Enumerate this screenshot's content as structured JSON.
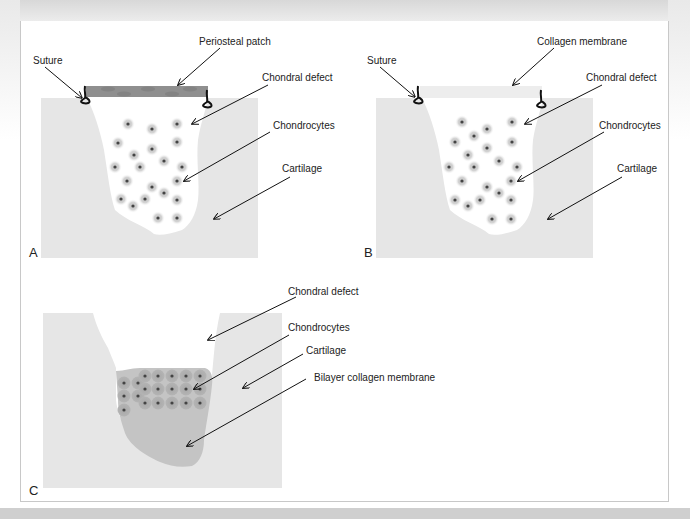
{
  "panels": {
    "A": {
      "letter": "A",
      "labels": {
        "suture": "Suture",
        "patch": "Periosteal patch",
        "defect": "Chondral defect",
        "chondrocytes": "Chondrocytes",
        "cartilage": "Cartilage"
      }
    },
    "B": {
      "letter": "B",
      "labels": {
        "suture": "Suture",
        "membrane": "Collagen membrane",
        "defect": "Chondral defect",
        "chondrocytes": "Chondrocytes",
        "cartilage": "Cartilage"
      }
    },
    "C": {
      "letter": "C",
      "labels": {
        "defect": "Chondral defect",
        "chondrocytes": "Chondrocytes",
        "cartilage": "Cartilage",
        "membrane": "Bilayer collagen membrane"
      }
    }
  },
  "colors": {
    "cartilage": "#e6e6e6",
    "defect": "#ffffff",
    "patch": "#8f8f8f",
    "membrane_c": "#c4c4c4",
    "cell_halo": "#d0d0d0",
    "cell_nucleus": "#444444",
    "suture": "#111111"
  }
}
